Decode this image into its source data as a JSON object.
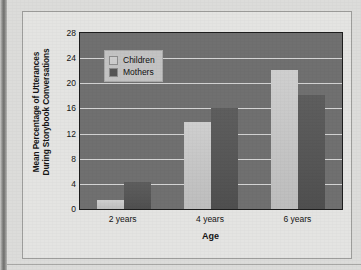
{
  "figure": {
    "background_color": "#e4e4e2",
    "plot_background_color": "#707070"
  },
  "legend": {
    "position": "top-left-inside",
    "entries": [
      {
        "label": "Children",
        "color": "#cdcdcd"
      },
      {
        "label": "Mothers",
        "color": "#565656"
      }
    ]
  },
  "axes": {
    "y_title_line1": "Mean Percentage of Utterances",
    "y_title_line2": "During Storybook Conversations",
    "x_title": "Age"
  },
  "chart_data": {
    "type": "bar",
    "title": "",
    "xlabel": "Age",
    "ylabel": "Mean Percentage of Utterances During Storybook Conversations",
    "categories": [
      "2 years",
      "4 years",
      "6 years"
    ],
    "series": [
      {
        "name": "Children",
        "color": "#cdcdcd",
        "values": [
          1.5,
          13.8,
          22.1
        ]
      },
      {
        "name": "Mothers",
        "color": "#565656",
        "values": [
          4.3,
          16.0,
          18.1
        ]
      }
    ],
    "ylim": [
      0,
      28
    ],
    "yticks": [
      0,
      4,
      8,
      12,
      16,
      20,
      24,
      28
    ],
    "ytick_labels": [
      "0",
      "4",
      "8",
      "12",
      "16",
      "20",
      "24",
      "28"
    ],
    "grid": true,
    "grid_axis": "y",
    "grid_color": "#d4d4d4",
    "legend_position": "upper left"
  }
}
